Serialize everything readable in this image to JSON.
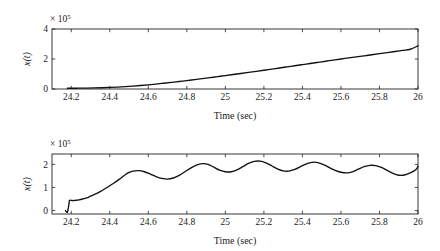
{
  "figure": {
    "background_color": "#ffffff",
    "line_color": "#111111",
    "axis_color": "#222222"
  },
  "chart_data": [
    {
      "type": "line",
      "panel": "top",
      "title": "",
      "xlabel": "Time (sec)",
      "ylabel": "x(t)",
      "y_exponent_prefix": "× 10",
      "y_exponent_power": "5",
      "xlim": [
        24.1,
        26.0
      ],
      "ylim": [
        0,
        4
      ],
      "xticks": [
        24.2,
        24.4,
        24.6,
        24.8,
        25,
        25.2,
        25.4,
        25.6,
        25.8,
        26
      ],
      "xtick_labels": [
        "24.2",
        "24.4",
        "24.6",
        "24.8",
        "25",
        "25.2",
        "25.4",
        "25.6",
        "25.8",
        "26"
      ],
      "yticks": [
        0,
        2,
        4
      ],
      "ytick_labels": [
        "0",
        "2",
        "4"
      ],
      "grid": false,
      "legend": "none",
      "units_note": "y values in units of 1e5",
      "x": [
        24.18,
        24.2,
        24.24,
        24.28,
        24.32,
        24.36,
        24.4,
        24.44,
        24.48,
        24.52,
        24.56,
        24.6,
        24.64,
        24.68,
        24.72,
        24.76,
        24.8,
        24.84,
        24.88,
        24.92,
        24.96,
        25.0,
        25.04,
        25.08,
        25.12,
        25.16,
        25.2,
        25.24,
        25.28,
        25.32,
        25.36,
        25.4,
        25.44,
        25.48,
        25.52,
        25.56,
        25.6,
        25.64,
        25.68,
        25.72,
        25.76,
        25.8,
        25.84,
        25.88,
        25.92,
        25.96,
        26.0
      ],
      "y": [
        0.05,
        0.05,
        0.055,
        0.06,
        0.07,
        0.085,
        0.105,
        0.13,
        0.16,
        0.195,
        0.235,
        0.28,
        0.33,
        0.385,
        0.44,
        0.5,
        0.56,
        0.625,
        0.69,
        0.755,
        0.825,
        0.895,
        0.965,
        1.035,
        1.105,
        1.18,
        1.25,
        1.325,
        1.4,
        1.475,
        1.55,
        1.625,
        1.7,
        1.775,
        1.85,
        1.925,
        2.0,
        2.07,
        2.14,
        2.21,
        2.285,
        2.355,
        2.43,
        2.5,
        2.575,
        2.65,
        2.88
      ]
    },
    {
      "type": "line",
      "panel": "bottom",
      "title": "",
      "xlabel": "Time (sec)",
      "ylabel": "x(t)",
      "y_exponent_prefix": "× 10",
      "y_exponent_power": "5",
      "xlim": [
        24.1,
        26.0
      ],
      "ylim": [
        -0.15,
        2.45
      ],
      "xticks": [
        24.2,
        24.4,
        24.6,
        24.8,
        25,
        25.2,
        25.4,
        25.6,
        25.8,
        26
      ],
      "xtick_labels": [
        "24.2",
        "24.4",
        "24.6",
        "24.8",
        "25",
        "25.2",
        "25.4",
        "25.6",
        "25.8",
        "26"
      ],
      "yticks": [
        0,
        1,
        2
      ],
      "ytick_labels": [
        "0",
        "1",
        "2"
      ],
      "grid": false,
      "legend": "none",
      "units_note": "y values in units of 1e5; initial sharp transient spike at t=24.18",
      "x": [
        24.17,
        24.18,
        24.185,
        24.19,
        24.2,
        24.21,
        24.22,
        24.24,
        24.26,
        24.28,
        24.3,
        24.33,
        24.36,
        24.39,
        24.42,
        24.45,
        24.48,
        24.5,
        24.52,
        24.55,
        24.58,
        24.61,
        24.64,
        24.67,
        24.7,
        24.73,
        24.76,
        24.79,
        24.82,
        24.85,
        24.88,
        24.91,
        24.94,
        24.97,
        25.0,
        25.03,
        25.06,
        25.09,
        25.12,
        25.15,
        25.18,
        25.21,
        25.24,
        25.27,
        25.3,
        25.33,
        25.36,
        25.39,
        25.42,
        25.45,
        25.48,
        25.51,
        25.54,
        25.57,
        25.6,
        25.63,
        25.66,
        25.69,
        25.72,
        25.75,
        25.78,
        25.81,
        25.84,
        25.87,
        25.9,
        25.93,
        25.96,
        25.99,
        26.0
      ],
      "y": [
        0.0,
        -0.08,
        0.12,
        0.42,
        0.44,
        0.43,
        0.44,
        0.46,
        0.5,
        0.55,
        0.62,
        0.73,
        0.87,
        1.02,
        1.18,
        1.36,
        1.55,
        1.65,
        1.71,
        1.73,
        1.68,
        1.58,
        1.47,
        1.39,
        1.36,
        1.41,
        1.52,
        1.68,
        1.84,
        1.97,
        2.03,
        2.0,
        1.88,
        1.75,
        1.68,
        1.68,
        1.76,
        1.9,
        2.04,
        2.13,
        2.14,
        2.07,
        1.94,
        1.81,
        1.72,
        1.71,
        1.78,
        1.9,
        2.02,
        2.09,
        2.08,
        1.99,
        1.86,
        1.74,
        1.66,
        1.63,
        1.68,
        1.79,
        1.9,
        1.96,
        1.95,
        1.87,
        1.74,
        1.61,
        1.53,
        1.54,
        1.63,
        1.78,
        1.92
      ]
    }
  ]
}
